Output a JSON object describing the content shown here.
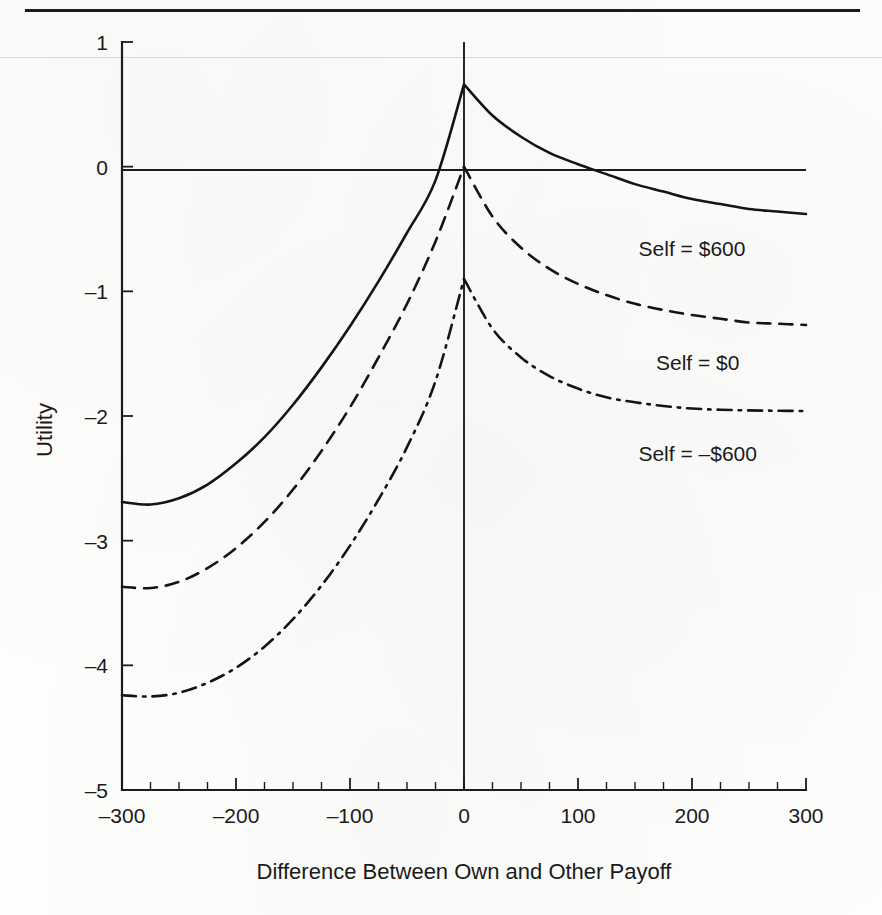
{
  "figure": {
    "background_color": "#fdfdfc",
    "ink_color": "#141414",
    "top_rule": true
  },
  "chart_data": {
    "type": "line",
    "title": "",
    "xlabel": "Difference Between Own and Other Payoff",
    "ylabel": "Utility",
    "xlim": [
      -300,
      300
    ],
    "ylim": [
      -5,
      1
    ],
    "grid": false,
    "legend_position": "inline-right-of-curve",
    "xticks": [
      -300,
      -200,
      -100,
      0,
      100,
      200,
      300
    ],
    "xtick_labels": [
      "–300",
      "–200",
      "–100",
      "0",
      "100",
      "200",
      "300"
    ],
    "xminor_tick_interval": 25,
    "yticks": [
      1,
      0,
      -1,
      -2,
      -3,
      -4,
      -5
    ],
    "ytick_labels": [
      "1",
      "0",
      "–1",
      "–2",
      "–3",
      "–4",
      "–5"
    ],
    "zero_lines": {
      "horizontal_y": 0,
      "vertical_x": 0
    },
    "series": [
      {
        "name": "Self = $600",
        "label": "Self = $600",
        "style": "solid",
        "peak_x": 0,
        "peak_y": 0.66,
        "left_end_y": -2.69,
        "right_end_y": -0.38,
        "zero_crossing_x": 118,
        "x": [
          -300,
          -275,
          -250,
          -225,
          -200,
          -175,
          -150,
          -125,
          -100,
          -75,
          -50,
          -25,
          0,
          25,
          50,
          75,
          100,
          125,
          150,
          175,
          200,
          225,
          250,
          275,
          300
        ],
        "y": [
          -2.69,
          -2.71,
          -2.66,
          -2.55,
          -2.38,
          -2.17,
          -1.91,
          -1.61,
          -1.28,
          -0.92,
          -0.53,
          -0.11,
          0.66,
          0.41,
          0.24,
          0.11,
          0.02,
          -0.06,
          -0.14,
          -0.2,
          -0.26,
          -0.3,
          -0.34,
          -0.36,
          -0.38
        ]
      },
      {
        "name": "Self = $0",
        "label": "Self = $0",
        "style": "dashed",
        "peak_x": 0,
        "peak_y": 0.0,
        "left_end_y": -3.37,
        "right_end_y": -1.27,
        "x": [
          -300,
          -275,
          -250,
          -225,
          -200,
          -175,
          -150,
          -125,
          -100,
          -75,
          -50,
          -25,
          0,
          25,
          50,
          75,
          100,
          125,
          150,
          175,
          200,
          225,
          250,
          275,
          300
        ],
        "y": [
          -3.37,
          -3.38,
          -3.33,
          -3.22,
          -3.06,
          -2.85,
          -2.59,
          -2.28,
          -1.93,
          -1.53,
          -1.1,
          -0.6,
          0.0,
          -0.4,
          -0.65,
          -0.82,
          -0.94,
          -1.03,
          -1.1,
          -1.15,
          -1.19,
          -1.22,
          -1.25,
          -1.26,
          -1.27
        ]
      },
      {
        "name": "Self = -$600",
        "label": "Self = –$600",
        "style": "dash-dot",
        "peak_x": 0,
        "peak_y": -0.9,
        "left_end_y": -4.24,
        "right_end_y": -1.96,
        "x": [
          -300,
          -275,
          -250,
          -225,
          -200,
          -175,
          -150,
          -125,
          -100,
          -75,
          -50,
          -25,
          0,
          25,
          50,
          75,
          100,
          125,
          150,
          175,
          200,
          225,
          250,
          275,
          300
        ],
        "y": [
          -4.24,
          -4.25,
          -4.22,
          -4.14,
          -4.02,
          -3.85,
          -3.63,
          -3.36,
          -3.04,
          -2.67,
          -2.25,
          -1.72,
          -0.9,
          -1.3,
          -1.53,
          -1.68,
          -1.78,
          -1.85,
          -1.89,
          -1.92,
          -1.94,
          -1.95,
          -1.955,
          -1.958,
          -1.96
        ]
      }
    ],
    "annotations": [
      {
        "text": "Self = $600",
        "x": 200,
        "y": -0.72
      },
      {
        "text": "Self = $0",
        "x": 205,
        "y": -1.63
      },
      {
        "text": "Self = –$600",
        "x": 205,
        "y": -2.36
      }
    ]
  }
}
